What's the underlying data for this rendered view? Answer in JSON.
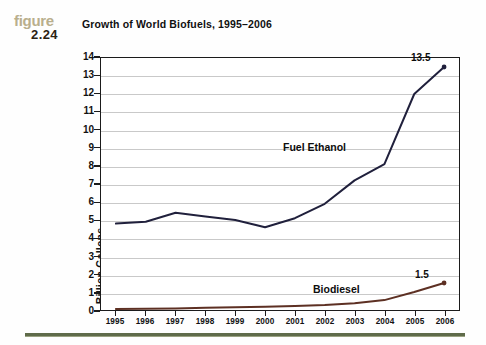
{
  "figure": {
    "word": "figure",
    "number": "2.24",
    "word_color": "#b9af8d",
    "number_color": "#2b2112"
  },
  "title": "Growth of World Biofuels, 1995–2006",
  "bottom_rule_color": "#5f6b4a",
  "chart_data": {
    "type": "line",
    "title": "Growth of World Biofuels, 1995–2006",
    "xlabel": "",
    "ylabel": "Billion Gallons",
    "x": [
      "1995",
      "1996",
      "1997",
      "1998",
      "1999",
      "2000",
      "2001",
      "2002",
      "2003",
      "2004",
      "2005",
      "2006"
    ],
    "categories": [
      "1995",
      "1996",
      "1997",
      "1998",
      "1999",
      "2000",
      "2001",
      "2002",
      "2003",
      "2004",
      "2005",
      "2006"
    ],
    "ylim": [
      0,
      14
    ],
    "yticks": [
      0,
      1,
      2,
      3,
      4,
      5,
      6,
      7,
      8,
      9,
      10,
      11,
      12,
      13,
      14
    ],
    "ytick_labels": [
      "0",
      "1",
      "2",
      "3",
      "4",
      "5",
      "6",
      "7",
      "8",
      "9",
      "10",
      "11",
      "12",
      "13",
      "14"
    ],
    "grid": "horizontal",
    "legend": "inline-annotations",
    "series": [
      {
        "name": "Fuel Ethanol",
        "color": "#20203c",
        "values": [
          4.8,
          4.9,
          5.4,
          5.2,
          5.0,
          4.6,
          5.1,
          5.9,
          7.2,
          8.1,
          12.0,
          13.5
        ],
        "end_label": "13.5",
        "label_text": "Fuel Ethanol"
      },
      {
        "name": "Biodiesel",
        "color": "#5d3023",
        "values": [
          0.05,
          0.07,
          0.09,
          0.12,
          0.15,
          0.18,
          0.22,
          0.28,
          0.38,
          0.55,
          1.0,
          1.5
        ],
        "end_label": "1.5",
        "label_text": "Biodiesel"
      }
    ]
  }
}
